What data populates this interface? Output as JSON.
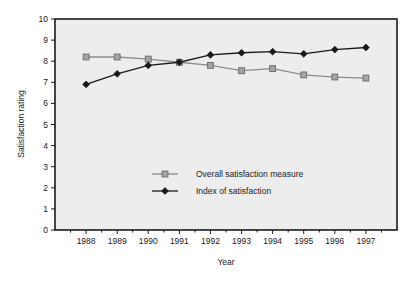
{
  "chart_data": {
    "type": "line",
    "title": "",
    "xlabel": "Year",
    "ylabel": "Satisfaction rating",
    "categories": [
      "1988",
      "1989",
      "1990",
      "1991",
      "1992",
      "1993",
      "1994",
      "1995",
      "1996",
      "1997"
    ],
    "x": [
      1988,
      1989,
      1990,
      1991,
      1992,
      1993,
      1994,
      1995,
      1996,
      1997
    ],
    "ylim": [
      0,
      10
    ],
    "yticks": [
      "0",
      "1",
      "2",
      "3",
      "4",
      "5",
      "6",
      "7",
      "8",
      "9",
      "10"
    ],
    "ytick_values": [
      0,
      1,
      2,
      3,
      4,
      5,
      6,
      7,
      8,
      9,
      10
    ],
    "grid": false,
    "legend_position": "center",
    "series": [
      {
        "name": "Overall satisfaction measure",
        "marker": "square",
        "color": "#8c8c8c",
        "line_color": "#8c8c8c",
        "values": [
          8.2,
          8.2,
          8.1,
          7.95,
          7.8,
          7.55,
          7.65,
          7.35,
          7.25,
          7.2
        ]
      },
      {
        "name": "Index of satisfaction",
        "marker": "diamond",
        "color": "#1a1a1a",
        "line_color": "#1a1a1a",
        "values": [
          6.9,
          7.4,
          7.8,
          7.95,
          8.3,
          8.4,
          8.45,
          8.35,
          8.55,
          8.65
        ]
      }
    ]
  },
  "legend": {
    "items": [
      {
        "label": "Overall satisfaction measure"
      },
      {
        "label": "Index of satisfaction"
      }
    ]
  },
  "axes": {
    "x_title": "Year",
    "y_title": "Satisfaction rating"
  },
  "colors": {
    "plot_background": "#ededed",
    "frame": "#1a1a1a",
    "series_overall": "#8c8c8c",
    "series_index": "#1a1a1a",
    "text": "#1a1a1a"
  }
}
